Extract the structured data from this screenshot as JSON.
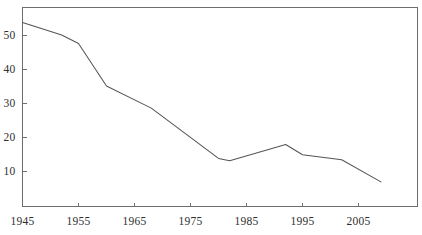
{
  "chart_data": {
    "type": "line",
    "title": "",
    "subtitle": "",
    "xlabel": "",
    "ylabel": "",
    "xlim": [
      1945,
      2010
    ],
    "ylim": [
      0,
      56
    ],
    "grid": false,
    "legend": null,
    "legend_position": "none",
    "x_ticks": [
      1945,
      1955,
      1965,
      1975,
      1985,
      1995,
      2005
    ],
    "x_tick_labels": [
      "1945",
      "1955",
      "1965",
      "1975",
      "1985",
      "1995",
      "2005"
    ],
    "y_ticks": [
      10,
      20,
      30,
      40,
      50
    ],
    "y_tick_labels": [
      "10",
      "20",
      "30",
      "40",
      "50"
    ],
    "series": [
      {
        "name": "series-1",
        "color": "#555555",
        "x": [
          1945,
          1952,
          1955,
          1960,
          1968,
          1980,
          1982,
          1992,
          1995,
          2002,
          2009
        ],
        "values": [
          53.7,
          50.0,
          47.5,
          35.0,
          28.5,
          13.7,
          13.0,
          17.8,
          14.8,
          13.3,
          6.8
        ]
      }
    ],
    "points": [
      {
        "x": 1945,
        "y": 53.7
      },
      {
        "x": 1952,
        "y": 50.0
      },
      {
        "x": 1955,
        "y": 47.5
      },
      {
        "x": 1960,
        "y": 35.0
      },
      {
        "x": 1968,
        "y": 28.5
      },
      {
        "x": 1980,
        "y": 13.7
      },
      {
        "x": 1982,
        "y": 13.0
      },
      {
        "x": 1992,
        "y": 17.8
      },
      {
        "x": 1995,
        "y": 14.8
      },
      {
        "x": 2002,
        "y": 13.3
      },
      {
        "x": 2009,
        "y": 6.8
      }
    ],
    "annotations": [],
    "colors": {
      "line": "#555555",
      "axis": "#6e6e6e",
      "text": "#2e2e2e",
      "background": "#ffffff"
    }
  }
}
